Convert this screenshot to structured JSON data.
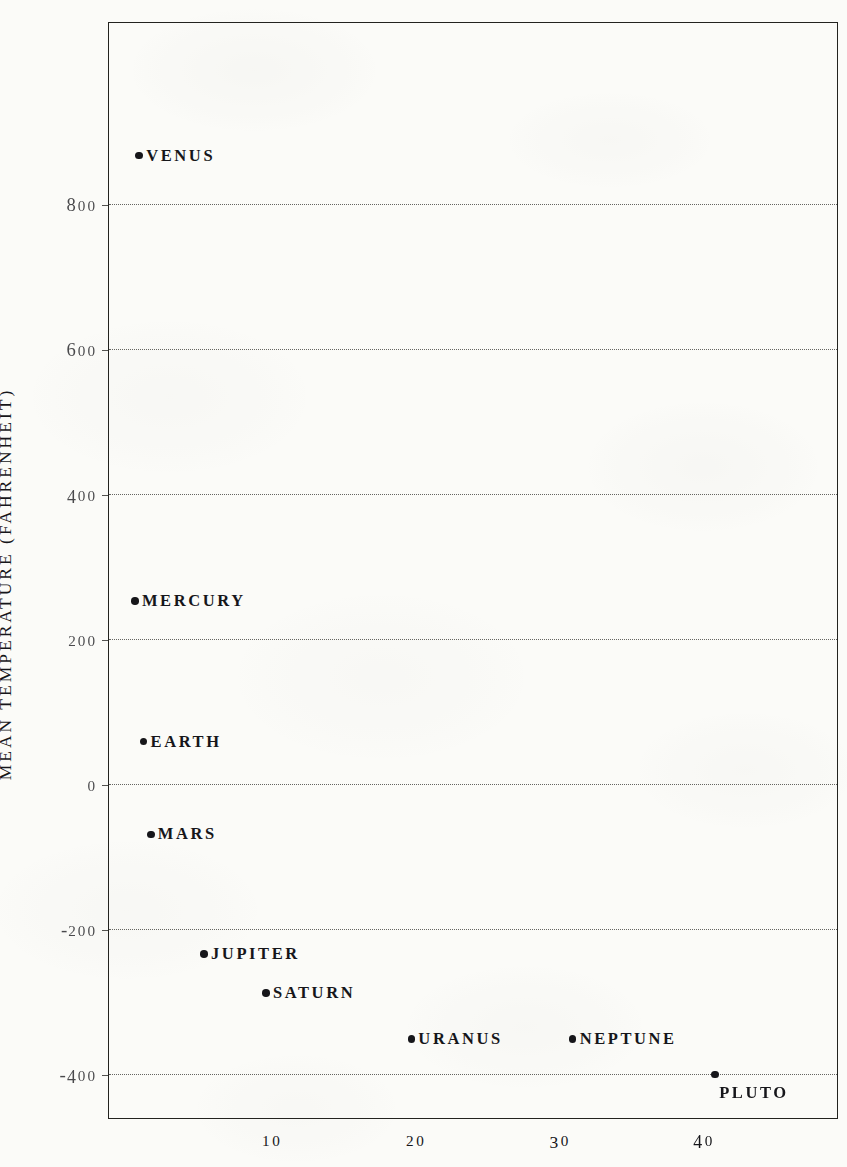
{
  "figure": {
    "background_color": "#fbfbf8",
    "ink_color": "#16161a",
    "y_axis_title": "MEAN TEMPERATURE (FAHRENHEIT)"
  },
  "chart_data": {
    "type": "scatter",
    "title": "",
    "xlabel": "",
    "ylabel": "MEAN TEMPERATURE (FAHRENHEIT)",
    "xlim": [
      -1.4,
      49.3
    ],
    "ylim": [
      -463,
      1050
    ],
    "grid": true,
    "legend": null,
    "xticks": [
      10,
      20,
      30,
      40
    ],
    "xtick_labels": [
      "10",
      "20",
      "30",
      "40"
    ],
    "yticks": [
      800,
      600,
      400,
      200,
      0,
      -200,
      -400
    ],
    "ytick_labels": [
      "800",
      "600",
      "400",
      "200",
      "0",
      "-200",
      "-400"
    ],
    "point_label_format": "planet name placed beside marker",
    "points": [
      {
        "label": "VENUS",
        "x": 0.7,
        "y": 867,
        "label_pos": "right"
      },
      {
        "label": "MERCURY",
        "x": 0.4,
        "y": 253,
        "label_pos": "right"
      },
      {
        "label": "EARTH",
        "x": 1.0,
        "y": 59,
        "label_pos": "right"
      },
      {
        "label": "MARS",
        "x": 1.5,
        "y": -69,
        "label_pos": "right"
      },
      {
        "label": "JUPITER",
        "x": 5.2,
        "y": -234,
        "label_pos": "right"
      },
      {
        "label": "SATURN",
        "x": 9.5,
        "y": -288,
        "label_pos": "right"
      },
      {
        "label": "URANUS",
        "x": 19.6,
        "y": -351,
        "label_pos": "right"
      },
      {
        "label": "NEPTUNE",
        "x": 30.8,
        "y": -351,
        "label_pos": "right"
      },
      {
        "label": "PLUTO",
        "x": 40.7,
        "y": -400,
        "label_pos": "below"
      }
    ]
  }
}
